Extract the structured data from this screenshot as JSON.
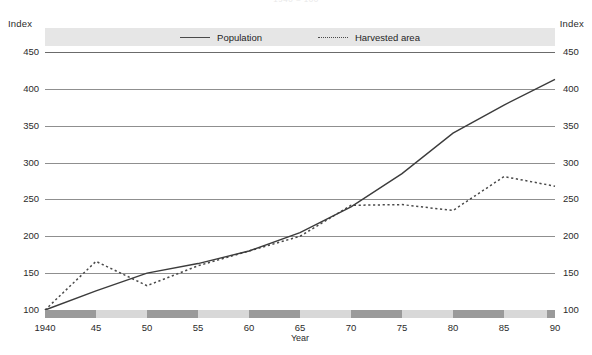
{
  "title": "1940 = 100",
  "axes": {
    "left_unit": "Index",
    "right_unit": "Index",
    "x_title": "Year"
  },
  "legend": {
    "items": [
      {
        "label": "Population",
        "style": "solid",
        "color": "#4a4a4a"
      },
      {
        "label": "Harvested area",
        "style": "dotted",
        "color": "#4a4a4a"
      }
    ]
  },
  "chart_data": {
    "type": "line",
    "title": "1940 = 100",
    "xlabel": "Year",
    "ylabel": "Index",
    "xlim": [
      1940,
      1990
    ],
    "ylim": [
      100,
      450
    ],
    "ytick_values": [
      100,
      150,
      200,
      250,
      300,
      350,
      400,
      450
    ],
    "ytick_labels": [
      "100",
      "150",
      "200",
      "250",
      "300",
      "350",
      "400",
      "450"
    ],
    "xtick_values": [
      1940,
      1945,
      1950,
      1955,
      1960,
      1965,
      1970,
      1975,
      1980,
      1985,
      1990
    ],
    "xtick_labels": [
      "1940",
      "45",
      "50",
      "55",
      "60",
      "65",
      "70",
      "75",
      "80",
      "85",
      "90"
    ],
    "grid": "horizontal",
    "legend_position": "top-center",
    "x": [
      1940,
      1945,
      1950,
      1955,
      1960,
      1965,
      1970,
      1975,
      1980,
      1985,
      1990
    ],
    "series": [
      {
        "name": "Population",
        "style": "solid",
        "values": [
          100,
          126,
          150,
          163,
          180,
          205,
          240,
          285,
          340,
          378,
          413
        ]
      },
      {
        "name": "Harvested area",
        "style": "dotted",
        "values": [
          100,
          166,
          133,
          160,
          180,
          200,
          242,
          243,
          235,
          281,
          268
        ]
      }
    ]
  }
}
